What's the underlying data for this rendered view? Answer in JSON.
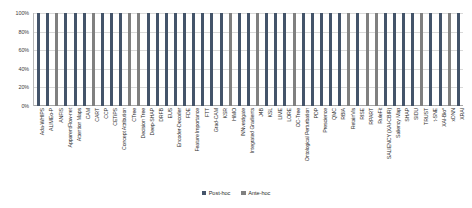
{
  "chart_data": {
    "type": "bar",
    "title": "",
    "xlabel": "",
    "ylabel": "",
    "stacked": true,
    "normalized": true,
    "grid": true,
    "legend_position": "bottom-center",
    "ylim": [
      0,
      100
    ],
    "ytick_labels": [
      "100%",
      "80%",
      "60%",
      "40%",
      "20%",
      "0%"
    ],
    "ytick_values": [
      100,
      80,
      60,
      40,
      20,
      0
    ],
    "legend": [
      {
        "name": "Post-hoc",
        "color": "#44546a"
      },
      {
        "name": "Ante-hoc",
        "color": "#808080"
      }
    ],
    "categories": [
      "Ada-WHIPS",
      "ALIMEo-P",
      "ANFIS",
      "ApparentFlow-net",
      "Attention Maps",
      "CAM",
      "CART",
      "CCP",
      "CETiPS",
      "Concept Attribution",
      "CTree",
      "Decision Tree",
      "Deep-SHAP",
      "DRFB",
      "EUS",
      "Encoder-Decoder",
      "FDE",
      "Feature Importance",
      "FTT",
      "Grad-CAM",
      "KSR",
      "HiMO",
      "INNvestigate",
      "Integrated Gradients",
      "J4B",
      "KSL",
      "LIME",
      "LORE",
      "OC-Tree",
      "Ontological Perturbation",
      "PDP",
      "Prescience",
      "QMC",
      "RBIA",
      "RetainVis",
      "RISE",
      "RPART",
      "RuleFit",
      "SALIENCY (XAI-CBIR)",
      "Saliency Map",
      "SHAP",
      "SIDU",
      "TRUST",
      "t-SNE",
      "XAI-Bio*",
      "xDNN",
      "XRAI"
    ],
    "series": [
      {
        "name": "Post-hoc",
        "color": "#44546a",
        "values": [
          100,
          100,
          0,
          100,
          100,
          100,
          0,
          100,
          100,
          100,
          0,
          0,
          100,
          100,
          100,
          100,
          100,
          100,
          100,
          100,
          100,
          0,
          100,
          100,
          0,
          100,
          100,
          100,
          0,
          100,
          100,
          100,
          100,
          100,
          0,
          100,
          0,
          0,
          100,
          100,
          100,
          100,
          0,
          100,
          100,
          0,
          100
        ]
      },
      {
        "name": "Ante-hoc",
        "color": "#808080",
        "values": [
          0,
          0,
          100,
          0,
          0,
          0,
          100,
          0,
          0,
          0,
          100,
          100,
          0,
          0,
          0,
          0,
          0,
          0,
          0,
          0,
          0,
          100,
          0,
          0,
          100,
          0,
          0,
          0,
          100,
          0,
          0,
          0,
          0,
          0,
          100,
          0,
          100,
          100,
          0,
          0,
          0,
          0,
          100,
          0,
          0,
          100,
          0
        ]
      }
    ]
  }
}
